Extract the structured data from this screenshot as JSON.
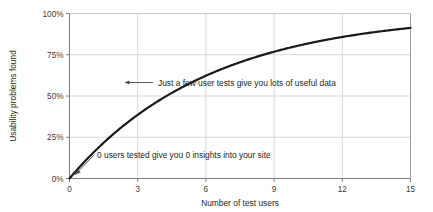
{
  "chart_data": {
    "type": "line",
    "title": "",
    "xlabel": "Number of test users",
    "ylabel": "Usability problems found",
    "xlim": [
      0,
      15
    ],
    "ylim": [
      0,
      100
    ],
    "grid": true,
    "legend": "none",
    "formula": "100 * (1 - 0.85^n)",
    "x_ticks": [
      "0",
      "3",
      "6",
      "9",
      "12",
      "15"
    ],
    "x_tick_values": [
      0,
      3,
      6,
      9,
      12,
      15
    ],
    "y_ticks": [
      "0%",
      "25%",
      "50%",
      "75%",
      "100%"
    ],
    "y_tick_values": [
      0,
      25,
      50,
      75,
      100
    ],
    "series": [
      {
        "name": "Usability problems found",
        "color": "#1a1a1a",
        "x": [
          0,
          0.5,
          1,
          1.5,
          2,
          2.5,
          3,
          3.5,
          4,
          4.5,
          5,
          5.5,
          6,
          6.5,
          7,
          7.5,
          8,
          8.5,
          9,
          9.5,
          10,
          10.5,
          11,
          11.5,
          12,
          12.5,
          13,
          13.5,
          14,
          14.5,
          15
        ],
        "values": [
          0.0,
          7.8,
          15.0,
          21.6,
          27.8,
          33.4,
          38.6,
          43.4,
          47.8,
          51.9,
          55.6,
          59.1,
          62.3,
          65.2,
          67.9,
          70.4,
          72.7,
          74.8,
          76.8,
          78.6,
          80.3,
          81.8,
          83.2,
          84.5,
          85.8,
          86.9,
          87.9,
          88.9,
          89.8,
          90.6,
          91.3
        ],
        "linewidth": 2.2
      }
    ],
    "annotations": [
      {
        "id": "annotation-few-users",
        "text": "Just a few user tests give you lots of useful data",
        "point_x": 2.65,
        "point_y": 57,
        "arrow": "left"
      },
      {
        "id": "annotation-zero-users",
        "text": "0 users tested give you 0 insights into your site",
        "point_x": 0.12,
        "point_y": 2,
        "arrow": "down-left"
      }
    ],
    "style": {
      "grid_color": "#d9d9d9",
      "axis_color": "#808080",
      "curve_color": "#1a1a1a",
      "text_color": "#231f20",
      "background": "#ffffff"
    }
  }
}
